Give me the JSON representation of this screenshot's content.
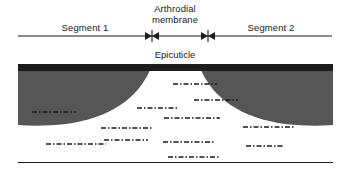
{
  "diagram": {
    "colors": {
      "epicuticle": "#1c1c1c",
      "exocuticle": "#565656",
      "endocuticle": "#ffffff",
      "line": "#1a1a1a",
      "label_light": "#ffffff",
      "label_dark": "#1a1a1a"
    }
  },
  "top_scale": {
    "segment_left_label": "Segment 1",
    "membrane_label_line1": "Arthrodial",
    "membrane_label_line2": "membrane",
    "segment_right_label": "Segment 2",
    "marker_icon": "double-arrow-marker",
    "axis_start_x": 18,
    "axis_end_x": 332,
    "marker_left_x": 152,
    "marker_right_x": 208
  },
  "layers": {
    "epicuticle_label": "Epicuticle",
    "exocuticle_left_label": "Exocuticle",
    "exocuticle_right_label": "Exocuticle",
    "endocuticle_label": "Endocuticle"
  },
  "lamellae": [
    {
      "x": 155,
      "y": 20,
      "w": 44
    },
    {
      "x": 176,
      "y": 36,
      "w": 44
    },
    {
      "x": 119,
      "y": 44,
      "w": 40
    },
    {
      "x": 146,
      "y": 54,
      "w": 56
    },
    {
      "x": 14,
      "y": 48,
      "w": 44
    },
    {
      "x": 83,
      "y": 64,
      "w": 52
    },
    {
      "x": 225,
      "y": 63,
      "w": 52
    },
    {
      "x": 86,
      "y": 76,
      "w": 44
    },
    {
      "x": 145,
      "y": 78,
      "w": 52
    },
    {
      "x": 228,
      "y": 82,
      "w": 38
    },
    {
      "x": 28,
      "y": 80,
      "w": 60
    },
    {
      "x": 150,
      "y": 93,
      "w": 52
    }
  ]
}
